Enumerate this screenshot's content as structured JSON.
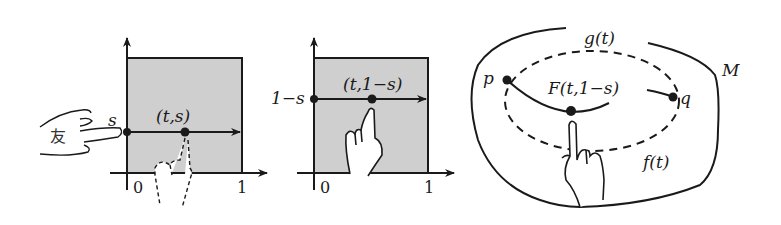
{
  "figure": {
    "panel_left": {
      "y_label": "s",
      "point_label": "(t,s)",
      "x_ticks": [
        "0",
        "1"
      ],
      "hand_char": "友",
      "fill_color": "#cfcfcf",
      "line_color": "#1a1a1a"
    },
    "panel_middle": {
      "y_label": "1−s",
      "point_label": "(t,1−s)",
      "x_ticks": [
        "0",
        "1"
      ],
      "fill_color": "#cfcfcf"
    },
    "panel_right": {
      "outer_label": "g(t)",
      "manifold_label": "M",
      "inner_label": "f(t)",
      "start_point": "p",
      "end_point": "q",
      "homotopy_label": "F(t,1−s)"
    }
  }
}
